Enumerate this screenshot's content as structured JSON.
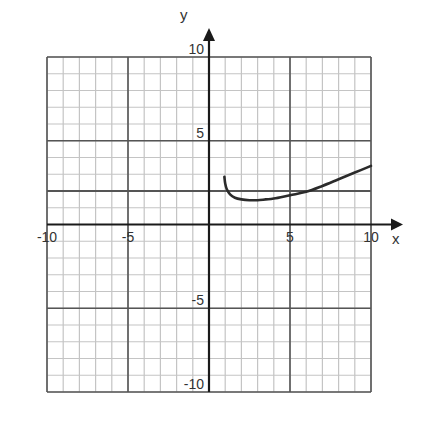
{
  "chart_data": {
    "type": "line",
    "title": "",
    "xlabel": "x",
    "ylabel": "y",
    "xlim": [
      -10,
      10
    ],
    "ylim": [
      -10,
      10
    ],
    "grid": true,
    "grid_minor_step": 1,
    "grid_major_step": 5,
    "x_ticks": [
      {
        "value": -10,
        "label": "-10"
      },
      {
        "value": -5,
        "label": "-5"
      },
      {
        "value": 5,
        "label": "5"
      },
      {
        "value": 10,
        "label": "10"
      }
    ],
    "y_ticks": [
      {
        "value": 10,
        "label": "10"
      },
      {
        "value": 5,
        "label": "5"
      },
      {
        "value": -5,
        "label": "-5"
      },
      {
        "value": -10,
        "label": "-10"
      }
    ],
    "reference_lines": [
      {
        "orientation": "horizontal",
        "y": 2,
        "label": "horizontal line at y = 2"
      }
    ],
    "series": [
      {
        "name": "curve",
        "x": [
          0.95,
          1.0,
          1.1,
          1.3,
          1.6,
          2.0,
          2.5,
          3.0,
          3.5,
          4.0,
          5.0,
          6.0,
          7.0,
          8.0,
          9.0,
          10.0
        ],
        "y": [
          2.85,
          2.45,
          2.1,
          1.8,
          1.6,
          1.5,
          1.45,
          1.45,
          1.5,
          1.55,
          1.75,
          1.95,
          2.3,
          2.7,
          3.1,
          3.5
        ]
      }
    ],
    "legend": null
  },
  "labels": {
    "x_axis": "x",
    "y_axis": "y"
  },
  "colors": {
    "axis": "#1a1a1a",
    "curve": "#2b2b2b",
    "minor_grid": "#c4c4c4",
    "major_grid": "#555555",
    "reference_line": "#555555"
  }
}
